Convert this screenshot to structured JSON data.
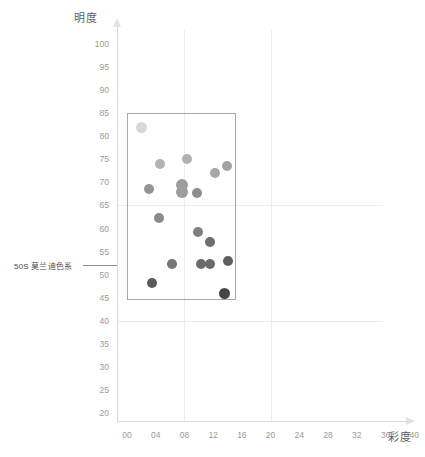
{
  "chart_data": {
    "type": "scatter",
    "title": "",
    "xlabel": "彩度",
    "ylabel": "明度",
    "xlim": [
      0,
      40
    ],
    "ylim": [
      20,
      100
    ],
    "grid": true,
    "legend_position": "none",
    "x_ticks": [
      "00",
      "04",
      "08",
      "12",
      "16",
      "20",
      "24",
      "28",
      "32",
      "36",
      "40"
    ],
    "x_tick_values": [
      0,
      4,
      8,
      12,
      16,
      20,
      24,
      28,
      32,
      36,
      40
    ],
    "y_ticks": [
      "100",
      "95",
      "90",
      "85",
      "80",
      "75",
      "70",
      "65",
      "60",
      "55",
      "50",
      "45",
      "40",
      "35",
      "30",
      "25",
      "20"
    ],
    "y_tick_values": [
      100,
      95,
      90,
      85,
      80,
      75,
      70,
      65,
      60,
      55,
      50,
      45,
      40,
      35,
      30,
      25,
      20
    ],
    "gridlines_v": [
      8,
      20
    ],
    "gridlines_h": [
      65,
      40
    ],
    "series": [
      {
        "name": "50S 莫兰迪色系",
        "points": [
          {
            "x": 2.0,
            "y": 82.0,
            "color": "#d8d8d8",
            "r": 5.5
          },
          {
            "x": 4.6,
            "y": 74.0,
            "color": "#b3b3b3",
            "r": 5.0
          },
          {
            "x": 8.3,
            "y": 75.0,
            "color": "#b0b0b0",
            "r": 5.0
          },
          {
            "x": 12.2,
            "y": 72.0,
            "color": "#a6a6a6",
            "r": 5.0
          },
          {
            "x": 13.9,
            "y": 73.5,
            "color": "#a3a3a3",
            "r": 5.0
          },
          {
            "x": 3.0,
            "y": 68.5,
            "color": "#949494",
            "r": 5.0
          },
          {
            "x": 7.6,
            "y": 69.4,
            "color": "#9d9d9d",
            "r": 6.0
          },
          {
            "x": 7.7,
            "y": 67.9,
            "color": "#9d9d9d",
            "r": 6.0
          },
          {
            "x": 9.7,
            "y": 67.7,
            "color": "#8e8e8e",
            "r": 5.0
          },
          {
            "x": 4.5,
            "y": 62.2,
            "color": "#8a8a8a",
            "r": 5.0
          },
          {
            "x": 9.9,
            "y": 59.3,
            "color": "#7e7e7e",
            "r": 5.0
          },
          {
            "x": 11.6,
            "y": 57.1,
            "color": "#6e6e6e",
            "r": 5.0
          },
          {
            "x": 6.3,
            "y": 52.3,
            "color": "#777777",
            "r": 5.0
          },
          {
            "x": 10.3,
            "y": 52.2,
            "color": "#6b6b6b",
            "r": 5.0
          },
          {
            "x": 11.5,
            "y": 52.2,
            "color": "#6b6b6b",
            "r": 5.0
          },
          {
            "x": 14.0,
            "y": 53.0,
            "color": "#5f5f5f",
            "r": 5.0
          },
          {
            "x": 3.5,
            "y": 48.2,
            "color": "#5a5a5a",
            "r": 5.0
          },
          {
            "x": 13.6,
            "y": 46.0,
            "color": "#454545",
            "r": 5.5
          }
        ]
      }
    ],
    "highlight_region": {
      "label": "50S 莫兰迪色系",
      "x_min": 0,
      "x_max": 15.2,
      "y_min": 44.5,
      "y_max": 85.0,
      "border_color": "#a8a8a8"
    },
    "annotation": {
      "text": "50S 莫兰迪色系",
      "y_value": 52
    },
    "colors": {
      "axis": "#d9d9d9",
      "gridline": "#ededed",
      "tick_label": "#9a9a9a",
      "axis_title": "#5d5d5d",
      "annotation": "#4e4e4e"
    }
  }
}
